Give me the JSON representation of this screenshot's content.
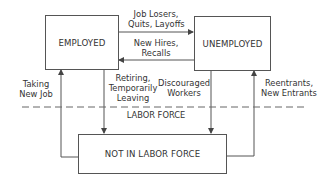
{
  "diagram": {
    "nodes": {
      "employed": "EMPLOYED",
      "unemployed": "UNEMPLOYED",
      "not_in_labor_force": "NOT IN LABOR FORCE"
    },
    "boundary_label": "LABOR FORCE",
    "flows": {
      "employed_to_unemployed": [
        "Job Losers,",
        "Quits, Layoffs"
      ],
      "unemployed_to_employed": [
        "New Hires,",
        "Recalls"
      ],
      "nilf_to_employed": [
        "Taking",
        "New Job"
      ],
      "employed_to_nilf": [
        "Retiring,",
        "Temporarily",
        "Leaving"
      ],
      "unemployed_to_nilf": [
        "Discouraged",
        "Workers"
      ],
      "nilf_to_unemployed": [
        "Reentrants,",
        "New Entrants"
      ]
    },
    "colors": {
      "line": "#555555",
      "text": "#333333",
      "background": "#ffffff"
    }
  }
}
